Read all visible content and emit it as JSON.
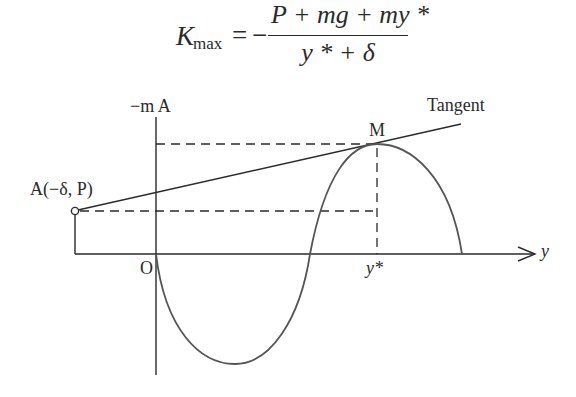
{
  "formula": {
    "lhs": "K",
    "lhs_sub": "max",
    "equals": "=",
    "sign": "−",
    "numerator": "P + mg + my *",
    "denominator": "y * + δ"
  },
  "diagram": {
    "vertical_axis_label": "−m A",
    "horizontal_axis_label": "y",
    "origin_label": "O",
    "point_a_label": "A(−δ, P)",
    "point_m_label": "M",
    "tangent_label": "Tangent",
    "y_star_label": "y*",
    "colors": {
      "line": "#2a2a2a",
      "curve": "#555555",
      "dashed": "#2a2a2a"
    }
  }
}
